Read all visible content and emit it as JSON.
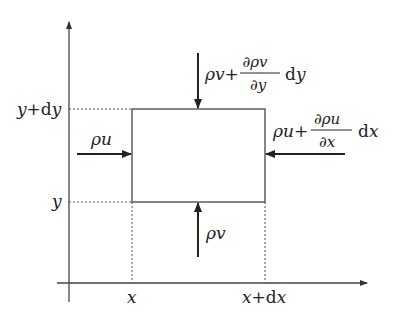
{
  "diagram": {
    "type": "control-volume-mass-flux",
    "axes": {
      "x_label": "",
      "y_label": ""
    },
    "ticks": {
      "x_left": "x",
      "x_right": "x+dx",
      "y_bottom": "y",
      "y_top": "y+dy"
    },
    "fluxes": {
      "left": {
        "base": "ρu"
      },
      "right": {
        "base": "ρu+",
        "num": "∂ρu",
        "den": "∂x",
        "diff": "dx"
      },
      "bottom": {
        "base": "ρv"
      },
      "top": {
        "base": "ρv+",
        "num": "∂ρv",
        "den": "∂y",
        "diff": "dy"
      }
    },
    "colors": {
      "line": "#333333",
      "dotted": "#555555"
    }
  }
}
